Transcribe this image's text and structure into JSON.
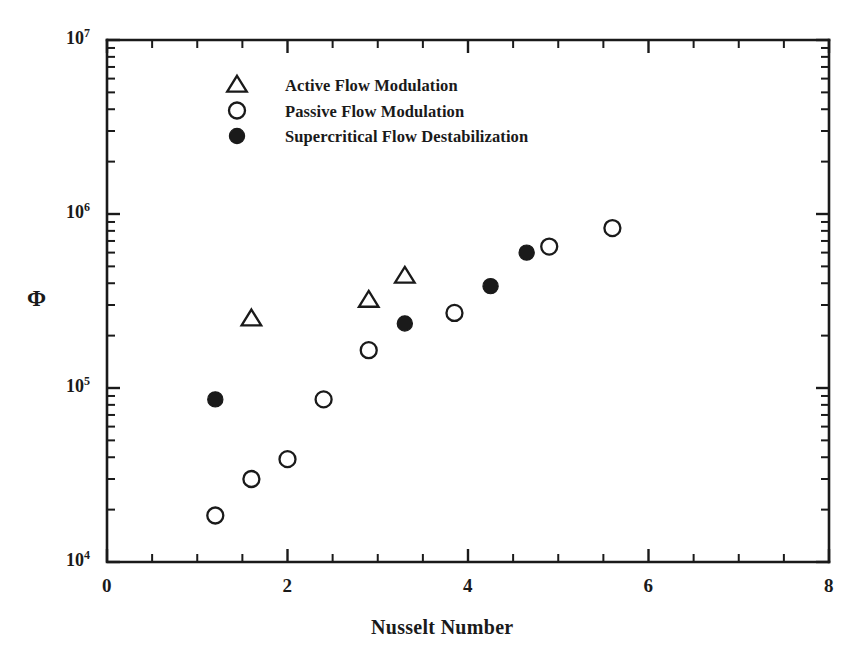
{
  "figure": {
    "background_color": "#ffffff",
    "ink_color": "#1a1a1a"
  },
  "axes": {
    "x_title": "Nusselt Number",
    "y_title": "Φ",
    "x_ticks": [
      "0",
      "2",
      "4",
      "6",
      "8"
    ],
    "y_ticks": [
      "10",
      "10",
      "10",
      "10"
    ],
    "y_tick_exponents": [
      "7",
      "6",
      "5",
      "4"
    ]
  },
  "legend": {
    "entries": [
      {
        "marker": "triangle-open-marker",
        "label": "Active Flow Modulation"
      },
      {
        "marker": "circle-open-marker",
        "label": "Passive Flow Modulation"
      },
      {
        "marker": "circle-filled-marker",
        "label": "Supercritical Flow Destabilization"
      }
    ]
  },
  "chart_data": {
    "type": "scatter",
    "title": "",
    "xlabel": "Nusselt Number",
    "ylabel": "Φ",
    "xlim": [
      0,
      8
    ],
    "ylim": [
      10000,
      10000000
    ],
    "yscale": "log",
    "xscale": "linear",
    "grid": false,
    "legend_position": "upper-left-inside",
    "x_major_ticks": [
      0,
      2,
      4,
      6,
      8
    ],
    "x_minor_tick_step": 0.5,
    "y_major_ticks": [
      10000,
      100000,
      1000000,
      10000000
    ],
    "series": [
      {
        "name": "Active Flow Modulation",
        "marker": "triangle-open",
        "points": [
          {
            "x": 1.6,
            "y": 250000
          },
          {
            "x": 2.9,
            "y": 320000
          },
          {
            "x": 3.3,
            "y": 440000
          }
        ]
      },
      {
        "name": "Passive Flow Modulation",
        "marker": "circle-open",
        "points": [
          {
            "x": 1.2,
            "y": 18500
          },
          {
            "x": 1.6,
            "y": 30000
          },
          {
            "x": 2.0,
            "y": 39000
          },
          {
            "x": 2.4,
            "y": 86000
          },
          {
            "x": 2.9,
            "y": 165000
          },
          {
            "x": 3.85,
            "y": 270000
          },
          {
            "x": 4.9,
            "y": 650000
          },
          {
            "x": 5.6,
            "y": 830000
          }
        ]
      },
      {
        "name": "Supercritical Flow Destabilization",
        "marker": "circle-filled",
        "points": [
          {
            "x": 1.2,
            "y": 86000
          },
          {
            "x": 3.3,
            "y": 235000
          },
          {
            "x": 4.25,
            "y": 385000
          },
          {
            "x": 4.65,
            "y": 600000
          }
        ]
      }
    ]
  }
}
